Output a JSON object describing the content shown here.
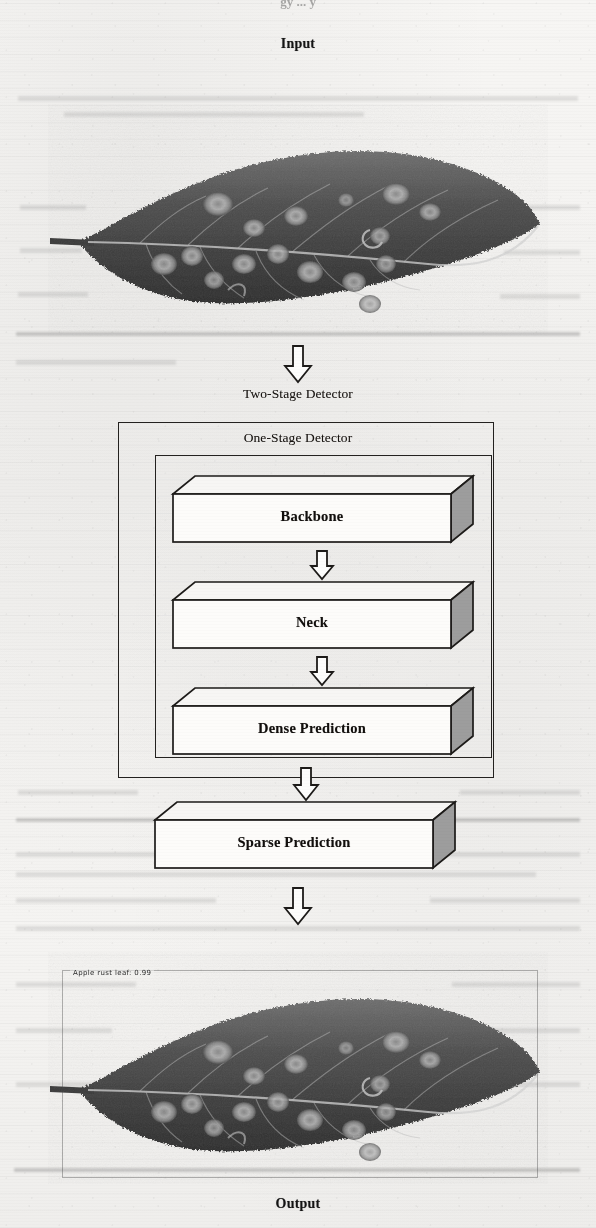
{
  "page": {
    "cut_off_header": "gy ... y",
    "background_color": "#f3f2f0"
  },
  "input_section": {
    "caption": "Input",
    "image_alt": "Apple leaf with rust lesions, grayscale scan"
  },
  "output_section": {
    "caption": "Output",
    "image_alt": "Apple leaf with rust lesions, grayscale scan with detection box",
    "detection": {
      "label": "Apple rust leaf: 0.99",
      "class_name": "Apple rust leaf",
      "confidence": "0.99"
    }
  },
  "diagram": {
    "outer_frame_label": "Two-Stage Detector",
    "inner_frame_label": "One-Stage Detector",
    "blocks": [
      {
        "label": "Backbone"
      },
      {
        "label": "Neck"
      },
      {
        "label": "Dense Prediction"
      },
      {
        "label": "Sparse Prediction"
      }
    ],
    "arrows": [
      {
        "name": "arrow-input-to-detector"
      },
      {
        "name": "arrow-backbone-to-neck"
      },
      {
        "name": "arrow-neck-to-dense"
      },
      {
        "name": "arrow-dense-to-sparse"
      },
      {
        "name": "arrow-detector-to-output"
      }
    ],
    "colors": {
      "line": "#23211f",
      "slab_face": "#fbfaf8",
      "slab_side": "#9d9d9d",
      "slab_top": "#f6f5f3"
    }
  }
}
